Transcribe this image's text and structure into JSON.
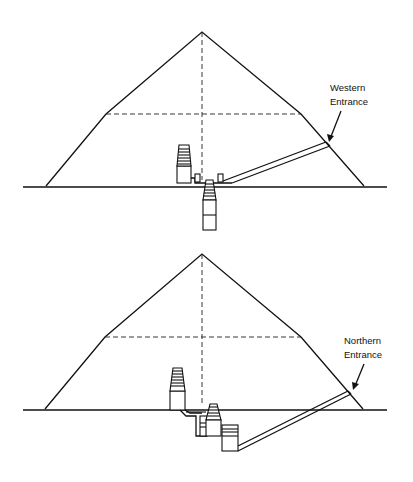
{
  "diagrams": [
    {
      "id": "western",
      "label_line1": "Western",
      "label_line2": "Entrance"
    },
    {
      "id": "northern",
      "label_line1": "Northern",
      "label_line2": "Entrance"
    }
  ]
}
